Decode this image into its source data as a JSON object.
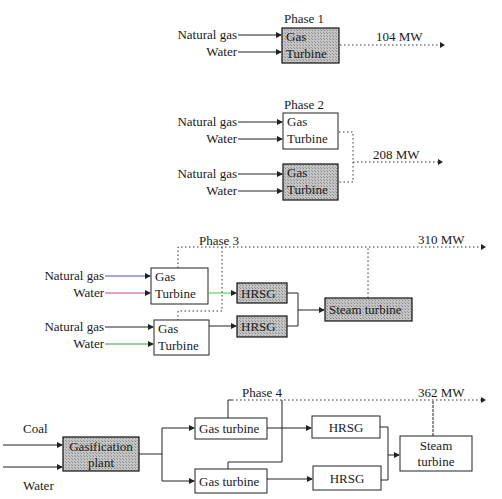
{
  "phases": {
    "p1": {
      "title": "Phase 1",
      "inputs": [
        "Natural gas",
        "Water"
      ],
      "gt": {
        "line1": "Gas",
        "line2": "Turbine"
      },
      "output": "104 MW"
    },
    "p2": {
      "title": "Phase 2",
      "inputs_top": [
        "Natural gas",
        "Water"
      ],
      "inputs_bottom": [
        "Natural gas",
        "Water"
      ],
      "gt": {
        "line1": "Gas",
        "line2": "Turbine"
      },
      "output": "208 MW"
    },
    "p3": {
      "title": "Phase 3",
      "inputs_top": [
        "Natural gas",
        "Water"
      ],
      "inputs_bottom": [
        "Natural gas",
        "Water"
      ],
      "gt": {
        "line1": "Gas",
        "line2": "Turbine"
      },
      "hrsg": "HRSG",
      "steam": "Steam turbine",
      "output": "310 MW"
    },
    "p4": {
      "title": "Phase 4",
      "inputs": [
        "Coal",
        "Water"
      ],
      "gasifier": {
        "line1": "Gasification",
        "line2": "plant"
      },
      "gt": "Gas turbine",
      "hrsg": "HRSG",
      "steam": {
        "line1": "Steam",
        "line2": "turbine"
      },
      "output": "362 MW"
    }
  },
  "colors": {
    "shade": "#b8b8b8",
    "line": "#222222",
    "blue_accent": "#4a4ad0",
    "green_accent": "#3ccf3c",
    "magenta_accent": "#d04a9a"
  }
}
